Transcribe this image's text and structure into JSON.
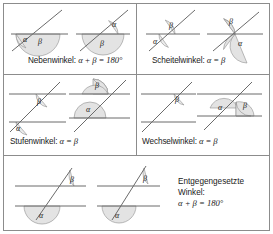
{
  "figure": {
    "colors": {
      "line": "#6b6b6b",
      "frame": "#8c8c8c",
      "angle_fill": "#e3e3e3",
      "angle_stroke": "#8f8f8f",
      "text": "#1a1a1a",
      "background": "#ffffff"
    },
    "symbols": {
      "alpha": "α",
      "beta": "β",
      "degree": "°",
      "equals": "=",
      "plus": "+"
    }
  },
  "rows": [
    {
      "row_index": 1,
      "cells": [
        {
          "id": "nebenwinkel",
          "caption_name": "Nebenwinkel",
          "caption_relation": "α + β = 180°",
          "caption_full": "Nebenwinkel: α + β = 180°",
          "diagrams": [
            {
              "id": "nebenwinkel-a",
              "labels": [
                "α",
                "β"
              ],
              "description": "Gerade mit schneidender Gerade, α klein links unten, β groß rechts unten"
            },
            {
              "id": "nebenwinkel-b",
              "labels": [
                "α",
                "β"
              ],
              "description": "α klein rechts oben, β groß unten"
            }
          ]
        },
        {
          "id": "scheitelwinkel",
          "caption_name": "Scheitelwinkel",
          "caption_relation": "α = β",
          "caption_full": "Scheitelwinkel: α = β",
          "diagrams": [
            {
              "id": "scheitelwinkel-a",
              "labels": [
                "α",
                "β"
              ],
              "description": "α klein links unten, β klein rechts oben"
            },
            {
              "id": "scheitelwinkel-b",
              "labels": [
                "β",
                "α"
              ],
              "description": "β groß links oben, α groß rechts unten"
            }
          ]
        }
      ]
    },
    {
      "row_index": 2,
      "cells": [
        {
          "id": "stufenwinkel",
          "caption_name": "Stufenwinkel",
          "caption_relation": "α = β",
          "caption_full": "Stufenwinkel: α = β",
          "diagrams": [
            {
              "id": "stufenwinkel-a",
              "labels": [
                "β",
                "α"
              ],
              "description": "Zwei Parallelen, β an oberer Geraden, α an unterer Geraden, beide klein"
            },
            {
              "id": "stufenwinkel-b",
              "labels": [
                "β",
                "α"
              ],
              "description": "Zwei Parallelen, β groß oben, α groß unten"
            }
          ]
        },
        {
          "id": "wechselwinkel",
          "caption_name": "Wechselwinkel",
          "caption_relation": "α = β",
          "caption_full": "Wechselwinkel: α = β",
          "diagrams": [
            {
              "id": "wechselwinkel-a",
              "labels": [
                "β"
              ],
              "description": "Zwei Parallelen, β klein an oberer Geraden rechts"
            },
            {
              "id": "wechselwinkel-b",
              "labels": [
                "α",
                "β"
              ],
              "description": "α groß links, β groß rechts"
            }
          ]
        }
      ]
    },
    {
      "row_index": 3,
      "cells": [
        {
          "id": "entgegengesetzte-winkel",
          "caption_line1": "Entgegengesetzte",
          "caption_line2": "Winkel:",
          "caption_line3": "α + β = 180°",
          "caption_full": "Entgegengesetzte Winkel: α + β = 180°",
          "diagrams": [
            {
              "id": "entgegen-a",
              "labels": [
                "β",
                "α"
              ],
              "description": "Zwei Parallelen, β klein oben rechts, α groß unten"
            },
            {
              "id": "entgegen-b",
              "labels": [
                "β",
                "α"
              ],
              "description": "Zwei Parallelen, β klein oben, α groß unten"
            }
          ]
        }
      ]
    }
  ]
}
